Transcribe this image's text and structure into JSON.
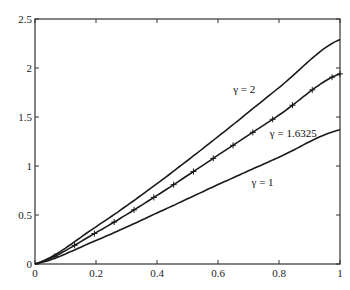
{
  "chart_data": {
    "type": "line",
    "title": "",
    "xlabel": "",
    "ylabel": "",
    "xlim": [
      0,
      1
    ],
    "ylim": [
      0,
      2.5
    ],
    "grid": false,
    "legend": "none (inline annotations)",
    "x_ticks": [
      "0",
      "0.2",
      "0.4",
      "0.6",
      "0.8",
      "1"
    ],
    "y_ticks": [
      "0",
      "0.5",
      "1",
      "1.5",
      "2",
      "2.5"
    ],
    "x": [
      0,
      0.2,
      0.4,
      0.6,
      0.8,
      1.0
    ],
    "series": [
      {
        "name": "γ = 2",
        "values": [
          0,
          0.38,
          0.82,
          1.3,
          1.8,
          2.29
        ],
        "marker": "none"
      },
      {
        "name": "γ = 1.6325",
        "values": [
          0,
          0.32,
          0.7,
          1.11,
          1.52,
          1.94
        ],
        "marker": "+"
      },
      {
        "name": "γ = 1",
        "values": [
          0,
          0.24,
          0.52,
          0.81,
          1.09,
          1.37
        ],
        "marker": "none"
      }
    ],
    "annotations": [
      {
        "text": "γ = 2",
        "x": 0.65,
        "y": 1.75
      },
      {
        "text": "γ = 1.6325",
        "x": 0.77,
        "y": 1.3
      },
      {
        "text": "γ = 1",
        "x": 0.71,
        "y": 0.8
      }
    ]
  }
}
